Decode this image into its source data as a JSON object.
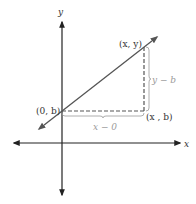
{
  "diagram": {
    "axes": {
      "x_label": "x",
      "y_label": "y"
    },
    "points": {
      "intercept": "(0, b)",
      "general": "(x, y)",
      "corner": "(x , b)"
    },
    "differences": {
      "vertical": "y − b",
      "horizontal": "x − 0"
    },
    "colors": {
      "line": "#555555",
      "axes": "#222222",
      "dashed": "#555555",
      "brace": "#9a9a9a"
    }
  }
}
